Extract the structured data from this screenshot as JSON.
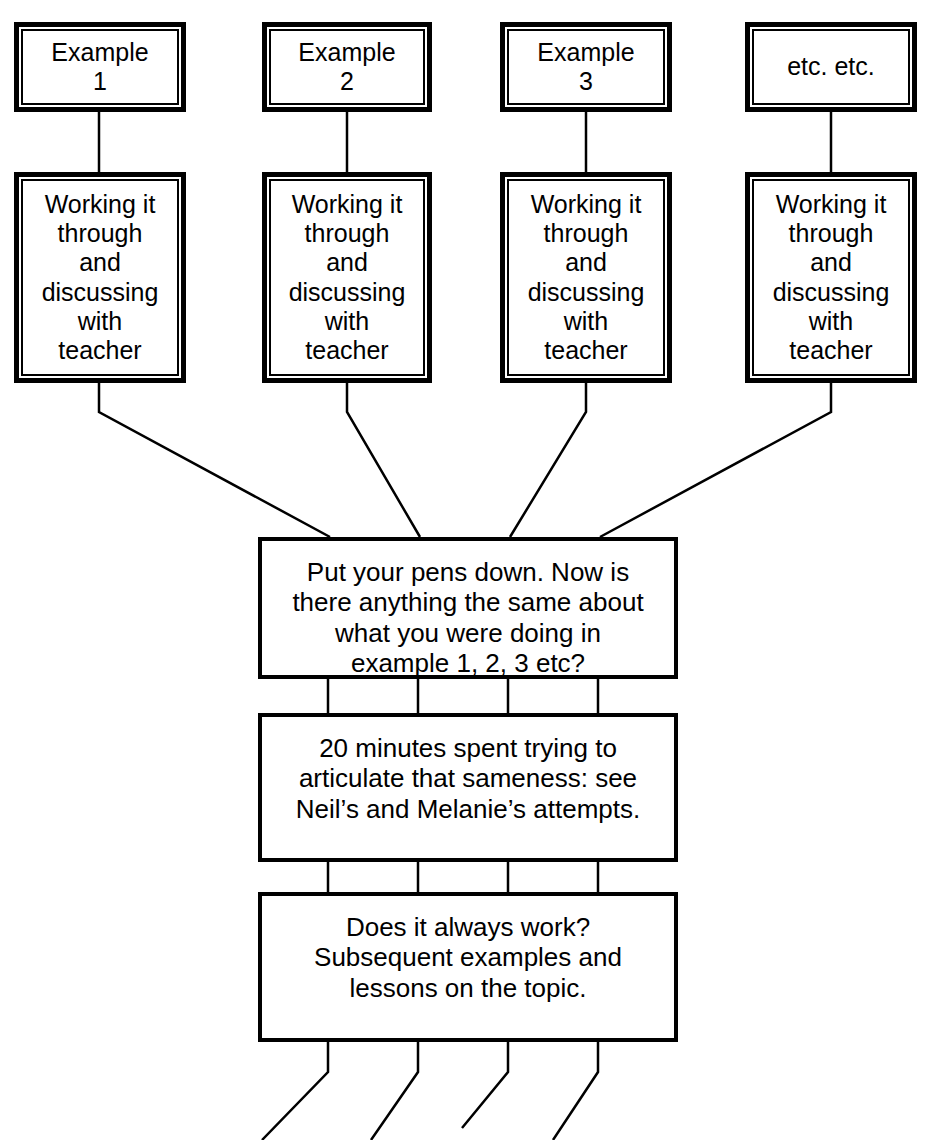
{
  "diagram": {
    "colors": {
      "stroke": "#000000",
      "fill": "#ffffff"
    },
    "top_row": [
      {
        "id": "example-1",
        "label": "Example\n1"
      },
      {
        "id": "example-2",
        "label": "Example\n2"
      },
      {
        "id": "example-3",
        "label": "Example\n3"
      },
      {
        "id": "etc",
        "label": "etc. etc."
      }
    ],
    "second_row": [
      {
        "id": "working-1",
        "label": "Working it\nthrough\nand\ndiscussing\nwith\nteacher"
      },
      {
        "id": "working-2",
        "label": "Working it\nthrough\nand\ndiscussing\nwith\nteacher"
      },
      {
        "id": "working-3",
        "label": "Working it\nthrough\nand\ndiscussing\nwith\nteacher"
      },
      {
        "id": "working-4",
        "label": "Working it\nthrough\nand\ndiscussing\nwith\nteacher"
      }
    ],
    "stages": [
      {
        "id": "stage-question",
        "label": "Put your pens down. Now is\nthere anything the same about\nwhat you were doing in\nexample 1, 2, 3 etc?"
      },
      {
        "id": "stage-articulate",
        "label": "20 minutes spent trying to\narticulate that sameness: see\nNeil’s and Melanie’s attempts."
      },
      {
        "id": "stage-followup",
        "label": "Does it always work?\nSubsequent examples and\nlessons on the topic."
      }
    ]
  }
}
